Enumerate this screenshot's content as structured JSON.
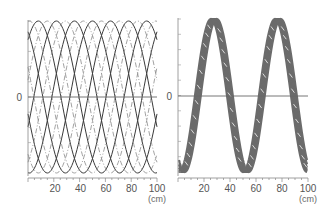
{
  "chart_data": [
    {
      "type": "line",
      "title": "",
      "xlabel": "(cm)",
      "ylabel": "",
      "xlim": [
        0,
        100
      ],
      "ylim": [
        -1,
        1
      ],
      "x_ticks": [
        "20",
        "40",
        "60",
        "80",
        "100"
      ],
      "y_ticks": [
        "0"
      ],
      "grid": false,
      "legend": "none",
      "description": "Family of phase-shifted sinusoids (period ~70 cm), solid and dash-dot curves overlaid",
      "series": [
        {
          "name": "solid sinusoids",
          "style": "solid",
          "count": 5,
          "period_cm": 70,
          "phase_step_cm": 14
        },
        {
          "name": "dash-dot sinusoids",
          "style": "dash-dot",
          "count": 5,
          "period_cm": 70,
          "phase_step_cm": 14
        }
      ]
    },
    {
      "type": "line",
      "title": "",
      "xlabel": "(cm)",
      "ylabel": "",
      "xlim": [
        0,
        100
      ],
      "ylim": [
        -1,
        1
      ],
      "x_ticks": [
        "20",
        "40",
        "60",
        "80",
        "100"
      ],
      "y_ticks": [
        "0"
      ],
      "grid": false,
      "legend": "none",
      "description": "Superposed sinusoids forming a thick band, period ~50 cm, peaks near 22 and 72 cm, troughs near 0, 48 and 98 cm",
      "series": [
        {
          "name": "superposed band",
          "style": "thick-hatched",
          "period_cm": 50,
          "peaks_cm": [
            22,
            72
          ],
          "troughs_cm": [
            0,
            48,
            98
          ]
        }
      ]
    }
  ],
  "left": {
    "zero_label": "0",
    "x_labels": [
      "20",
      "40",
      "60",
      "80",
      "100"
    ],
    "unit": "(cm)"
  },
  "right": {
    "zero_label": "0",
    "x_labels": [
      "20",
      "40",
      "60",
      "80",
      "100"
    ],
    "unit": "(cm)"
  },
  "colors": {
    "curve": "#3a3a3a",
    "band": "#6b6b6b",
    "axis": "#777777"
  }
}
